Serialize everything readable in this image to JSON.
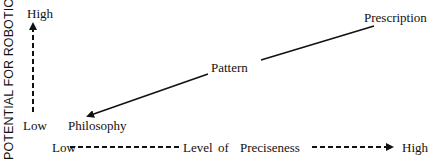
{
  "diagram": {
    "y_axis": {
      "title": "POTENTIAL FOR ROBOTICS",
      "high_label": "High",
      "low_label": "Low"
    },
    "x_axis": {
      "low_label": "Low",
      "title_word1": "Level",
      "title_word2": "of",
      "title_word3": "Preciseness",
      "high_label": "High"
    },
    "nodes": [
      {
        "label": "Philosophy"
      },
      {
        "label": "Pattern"
      },
      {
        "label": "Prescription"
      }
    ],
    "colors": {
      "ink": "#111111",
      "background": "#ffffff"
    }
  }
}
